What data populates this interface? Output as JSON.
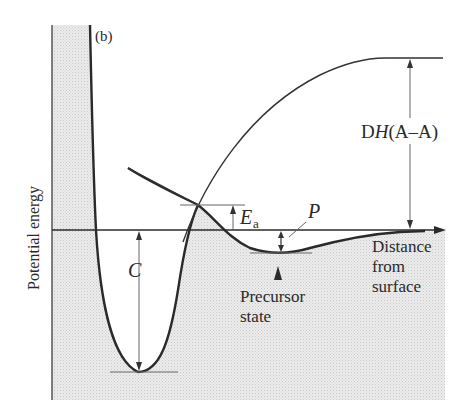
{
  "figure": {
    "panel_label": "(b)",
    "y_axis_label": "Potential energy",
    "x_axis_label_lines": [
      "Distance",
      "from",
      "surface"
    ],
    "annotations": {
      "chemisorption_depth": "C",
      "activation_energy_main": "E",
      "activation_energy_sub": "a",
      "physisorption_depth": "P",
      "dissociation_prefix": "D",
      "dissociation_italic": "H",
      "dissociation_suffix": "(A–A)",
      "precursor_lines": [
        "Precursor",
        "state"
      ]
    },
    "colors": {
      "line": "#2a2a2a",
      "thin_line": "#555555",
      "shading": "#e4e4e4",
      "background": "#ffffff"
    }
  }
}
